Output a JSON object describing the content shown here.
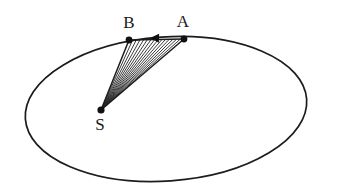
{
  "figure": {
    "background_color": "#ffffff",
    "stroke_color": "#1c1c1c",
    "hatch_color": "#242424",
    "dot_color": "#111111",
    "label_color": "#1a1a1a",
    "width": 337,
    "height": 194
  },
  "labels": {
    "point_a": "A",
    "point_b": "B",
    "focus_s": "S"
  },
  "chart_data": {
    "type": "diagram",
    "xlabel": "",
    "ylabel": "",
    "xlim": [
      0,
      337
    ],
    "ylim": [
      0,
      194
    ],
    "grid": false,
    "legend": "none",
    "ellipse": {
      "center_x": 166,
      "center_y": 109,
      "radius_x": 141,
      "radius_y": 72,
      "rotation_deg": -4.0,
      "stroke_width": 1.7
    },
    "points": [
      {
        "name": "A",
        "x": 184,
        "y": 39,
        "label": "A",
        "label_x": 183,
        "label_y": 27,
        "dot_radius": 3.4
      },
      {
        "name": "B",
        "x": 129,
        "y": 40,
        "label": "B",
        "label_x": 129,
        "label_y": 28,
        "dot_radius": 3.4
      },
      {
        "name": "S",
        "x": 101,
        "y": 110,
        "label": "S",
        "label_x": 100,
        "label_y": 130,
        "dot_radius": 3.6
      }
    ],
    "sector": {
      "vertices": [
        "S",
        "B",
        "A"
      ],
      "hatch_origin": "S",
      "hatch_line_count": 15,
      "hatch_description": "radial lines fanning from focus S to the chord between B and A"
    },
    "motion_arrow": {
      "from": "A",
      "to": "B",
      "tip_x": 150,
      "tip_y": 38,
      "tail_x": 184,
      "tail_y": 39,
      "direction": "leftward along chord from A to B"
    }
  }
}
